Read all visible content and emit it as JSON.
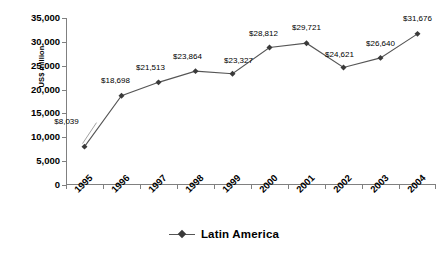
{
  "chart_data": {
    "type": "line",
    "title": "",
    "xlabel": "",
    "ylabel": "US$ million",
    "categories": [
      "1995",
      "1996",
      "1997",
      "1998",
      "1999",
      "2000",
      "2001",
      "2002",
      "2003",
      "2004"
    ],
    "series": [
      {
        "name": "Latin America",
        "values": [
          8039,
          18698,
          21513,
          23864,
          23327,
          28812,
          29721,
          24621,
          26640,
          31676
        ],
        "point_labels": [
          "$8,039",
          "$18,698",
          "$21,513",
          "$23,864",
          "$23,327",
          "$28,812",
          "$29,721",
          "$24,621",
          "$26,640",
          "$31,676"
        ],
        "marker": "diamond",
        "color": "#555555",
        "marker_color": "#3a3a3a"
      }
    ],
    "ylim": [
      0,
      35000
    ],
    "ytick_values": [
      0,
      5000,
      10000,
      15000,
      20000,
      25000,
      30000,
      35000
    ],
    "ytick_labels": [
      "0",
      "5,000",
      "10,000",
      "15,000",
      "20,000",
      "25,000",
      "30,000",
      "35,000"
    ],
    "grid": false,
    "legend_position": "bottom",
    "axis_color": "#808080"
  },
  "legend": {
    "entries": [
      {
        "label": "Latin America",
        "marker": "diamond-marker"
      }
    ]
  }
}
